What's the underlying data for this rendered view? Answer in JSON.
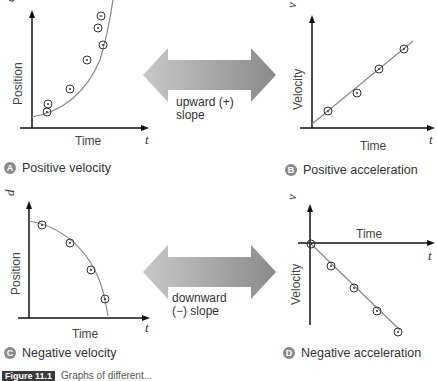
{
  "panels": {
    "A": {
      "badge": "A",
      "caption": "Positive velocity",
      "y_axis_label": "Position",
      "x_axis_label": "Time",
      "vector_label": "d",
      "t_label": "t"
    },
    "B": {
      "badge": "B",
      "caption": "Positive acceleration",
      "y_axis_label": "Velocity",
      "x_axis_label": "Time",
      "vector_label": "v",
      "t_label": "t"
    },
    "C": {
      "badge": "C",
      "caption": "Negative velocity",
      "y_axis_label": "Position",
      "x_axis_label": "Time",
      "vector_label": "d",
      "t_label": "t"
    },
    "D": {
      "badge": "D",
      "caption": "Negative acceleration",
      "y_axis_label": "Velocity",
      "x_axis_label": "Time",
      "vector_label": "v",
      "t_label": "t"
    }
  },
  "arrows": {
    "top": {
      "line1": "upward (+)",
      "line2": "slope"
    },
    "bottom": {
      "line1": "downward",
      "line2": "(−) slope"
    }
  },
  "figure_caption": {
    "tag": "Figure 11.1",
    "text": "Graphs of different..."
  },
  "colors": {
    "arrow_gray": "#9a9a9a",
    "badge_gray": "#8a8a8a",
    "curve_gray": "#888888"
  }
}
